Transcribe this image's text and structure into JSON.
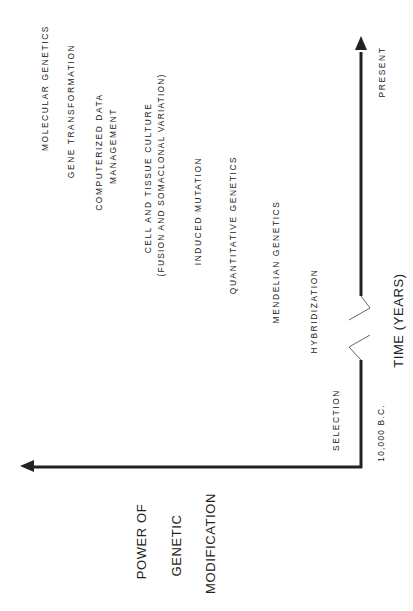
{
  "diagram": {
    "y_axis_label": [
      "POWER OF",
      "GENETIC",
      "MODIFICATION"
    ],
    "x_axis_label": "TIME (YEARS)",
    "x_axis_start": "10,000 B.C.",
    "x_axis_end": "PRESENT",
    "orientation": "rotated 90° counter-clockwise",
    "milestones": [
      {
        "label": "SELECTION"
      },
      {
        "label": "HYBRIDIZATION"
      },
      {
        "label": "MENDELIAN GENETICS"
      },
      {
        "label": "QUANTITATIVE GENETICS"
      },
      {
        "label": "INDUCED MUTATION"
      },
      {
        "label": "CELL AND TISSUE CULTURE",
        "sublabel": "(FUSION AND SOMACLONAL VARIATION)"
      },
      {
        "label": "COMPUTERIZED DATA",
        "sublabel": "MANAGEMENT"
      },
      {
        "label": "GENE TRANSFORMATION"
      },
      {
        "label": "MOLECULAR GENETICS"
      }
    ],
    "axis_break": "time axis break (zigzag)"
  }
}
